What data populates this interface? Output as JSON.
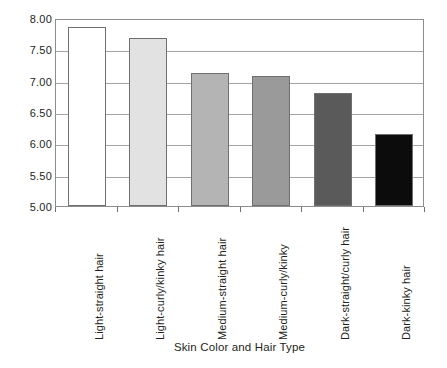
{
  "chart_data": {
    "type": "bar",
    "title": "",
    "xlabel": "Skin Color and Hair Type",
    "ylabel": "Years of Schooling",
    "categories": [
      "Light-straight hair",
      "Light-curly/kinky hair",
      "Medium-straight hair",
      "Medium-curly/kinky",
      "Dark-straight/curly hair",
      "Dark-kinky hair"
    ],
    "values": [
      7.85,
      7.68,
      7.12,
      7.08,
      6.8,
      6.15
    ],
    "ylim": [
      5.0,
      8.0
    ],
    "ytick_labels": [
      "8.00",
      "7.50",
      "7.00",
      "6.50",
      "6.00",
      "5.50",
      "5.00"
    ],
    "ytick_values": [
      8.0,
      7.5,
      7.0,
      6.5,
      6.0,
      5.5,
      5.0
    ],
    "grid": true,
    "legend": "none",
    "bar_colors": [
      "#ffffff",
      "#e2e2e2",
      "#b4b4b4",
      "#9a9a9a",
      "#5a5a5a",
      "#0c0c0c"
    ],
    "bar_border_color": "#6f6f6f",
    "gridline_color": "#a5a5a5",
    "frame_color": "#8d8d8d",
    "text_color": "#231f20"
  }
}
